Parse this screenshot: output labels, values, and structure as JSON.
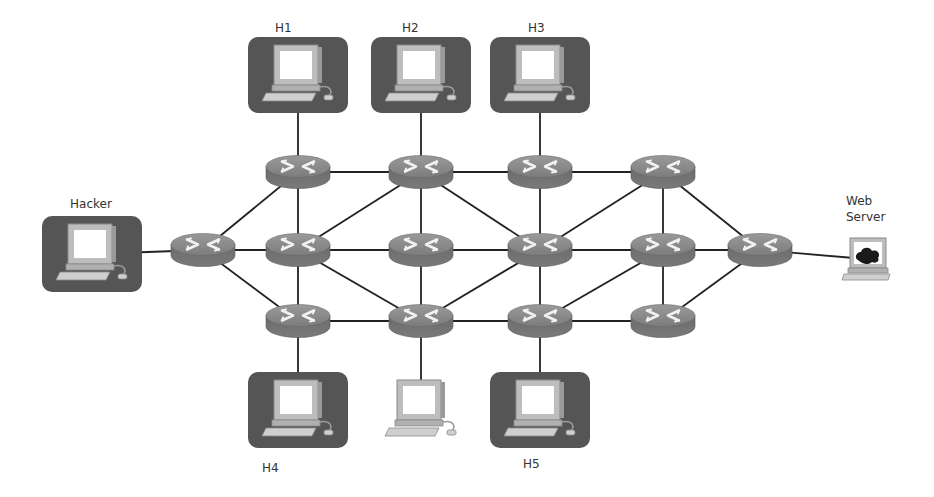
{
  "diagram": {
    "type": "network-topology",
    "colors": {
      "link": "#222222",
      "router_top": "#8c8c8c",
      "router_side": "#6e6e6e",
      "host_box": "#555555",
      "screen": "#ffffff"
    },
    "hosts": [
      {
        "id": "H1",
        "label": "H1",
        "highlighted": true,
        "x": 298,
        "y": 75,
        "label_x": 275,
        "label_y": 32
      },
      {
        "id": "H2",
        "label": "H2",
        "highlighted": true,
        "x": 421,
        "y": 75,
        "label_x": 402,
        "label_y": 32
      },
      {
        "id": "H3",
        "label": "H3",
        "highlighted": true,
        "x": 540,
        "y": 75,
        "label_x": 528,
        "label_y": 32
      },
      {
        "id": "Hacker",
        "label": "Hacker",
        "highlighted": true,
        "x": 92,
        "y": 254,
        "label_x": 70,
        "label_y": 208
      },
      {
        "id": "H4",
        "label": "H4",
        "highlighted": true,
        "x": 298,
        "y": 410,
        "label_x": 262,
        "label_y": 472
      },
      {
        "id": "PC",
        "label": "",
        "highlighted": false,
        "x": 421,
        "y": 410,
        "label_x": 0,
        "label_y": 0
      },
      {
        "id": "H5",
        "label": "H5",
        "highlighted": true,
        "x": 540,
        "y": 410,
        "label_x": 523,
        "label_y": 468
      }
    ],
    "server": {
      "id": "WebServer",
      "label_line1": "Web",
      "label_line2": "Server",
      "x": 868,
      "y": 258
    },
    "routers": [
      {
        "id": "RL",
        "x": 203,
        "y": 250
      },
      {
        "id": "A1",
        "x": 298,
        "y": 172
      },
      {
        "id": "A2",
        "x": 298,
        "y": 250
      },
      {
        "id": "A3",
        "x": 298,
        "y": 321
      },
      {
        "id": "B1",
        "x": 421,
        "y": 172
      },
      {
        "id": "B2",
        "x": 421,
        "y": 250
      },
      {
        "id": "B3",
        "x": 421,
        "y": 321
      },
      {
        "id": "C1",
        "x": 540,
        "y": 172
      },
      {
        "id": "C2",
        "x": 540,
        "y": 250
      },
      {
        "id": "C3",
        "x": 540,
        "y": 321
      },
      {
        "id": "D1",
        "x": 663,
        "y": 172
      },
      {
        "id": "D2",
        "x": 663,
        "y": 250
      },
      {
        "id": "D3",
        "x": 663,
        "y": 321
      },
      {
        "id": "RR",
        "x": 760,
        "y": 250
      }
    ],
    "links": [
      [
        "Hacker",
        "RL"
      ],
      [
        "H1",
        "A1"
      ],
      [
        "H2",
        "B1"
      ],
      [
        "H3",
        "C1"
      ],
      [
        "H4",
        "A3"
      ],
      [
        "PC",
        "B3"
      ],
      [
        "H5",
        "C3"
      ],
      [
        "RR",
        "WebServer"
      ],
      [
        "RL",
        "A1"
      ],
      [
        "RL",
        "A2"
      ],
      [
        "RL",
        "A3"
      ],
      [
        "A1",
        "B1"
      ],
      [
        "B1",
        "C1"
      ],
      [
        "C1",
        "D1"
      ],
      [
        "A2",
        "B2"
      ],
      [
        "B2",
        "C2"
      ],
      [
        "C2",
        "D2"
      ],
      [
        "D2",
        "RR"
      ],
      [
        "A3",
        "B3"
      ],
      [
        "B3",
        "C3"
      ],
      [
        "C3",
        "D3"
      ],
      [
        "A1",
        "A2"
      ],
      [
        "A2",
        "A3"
      ],
      [
        "B1",
        "B2"
      ],
      [
        "B2",
        "B3"
      ],
      [
        "C1",
        "C2"
      ],
      [
        "C2",
        "C3"
      ],
      [
        "D1",
        "D2"
      ],
      [
        "D2",
        "D3"
      ],
      [
        "B1",
        "A2"
      ],
      [
        "B1",
        "C2"
      ],
      [
        "A2",
        "B3"
      ],
      [
        "B3",
        "C2"
      ],
      [
        "C2",
        "D1"
      ],
      [
        "C3",
        "D2"
      ],
      [
        "D1",
        "RR"
      ],
      [
        "D3",
        "RR"
      ]
    ]
  }
}
